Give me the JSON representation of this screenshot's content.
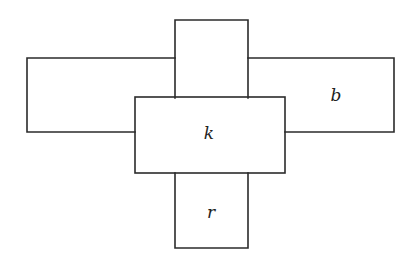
{
  "diagram": {
    "type": "rectangle-cross-arrangement",
    "stroke_color": "#2b2b2b",
    "background": "#ffffff",
    "regions": [
      {
        "id": "top",
        "label": "",
        "x1": 175,
        "y1": 20,
        "x2": 248,
        "y2": 97
      },
      {
        "id": "left",
        "label": "",
        "x1": 27,
        "y1": 58,
        "x2": 135,
        "y2": 132
      },
      {
        "id": "right",
        "label": "b",
        "x1": 285,
        "y1": 58,
        "x2": 394,
        "y2": 132
      },
      {
        "id": "center",
        "label": "k",
        "x1": 135,
        "y1": 97,
        "x2": 285,
        "y2": 173
      },
      {
        "id": "bottom",
        "label": "r",
        "x1": 175,
        "y1": 173,
        "x2": 248,
        "y2": 248
      }
    ],
    "labels": {
      "b": "b",
      "k": "k",
      "r": "r"
    }
  }
}
